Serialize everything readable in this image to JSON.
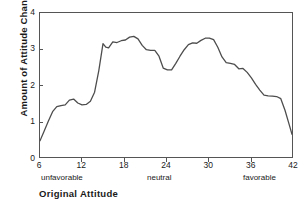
{
  "chart_data": {
    "type": "line",
    "title": "",
    "xlabel": "Original Attitude",
    "ylabel": "Amount of Attitude Change",
    "xlim": [
      6,
      42
    ],
    "ylim": [
      0,
      4
    ],
    "grid": false,
    "legend": null,
    "xticks": [
      6,
      12,
      18,
      24,
      30,
      36,
      42
    ],
    "xtick_labels": [
      "6",
      "12",
      "18",
      "24",
      "30",
      "36",
      "42"
    ],
    "yticks": [
      0,
      1,
      2,
      3,
      4
    ],
    "ytick_labels": [
      "0",
      "1",
      "2",
      "3",
      "4"
    ],
    "annotations": [
      {
        "text": "unfavorable",
        "x": 6,
        "position": "below-axis-left"
      },
      {
        "text": "neutral",
        "x": 24,
        "position": "below-axis-center"
      },
      {
        "text": "favorable",
        "x": 42,
        "position": "below-axis-right"
      }
    ],
    "series": [
      {
        "name": "Amount of Attitude Change",
        "color": "#4d4d4d",
        "x": [
          6.0,
          6.6,
          7.2,
          7.8,
          8.4,
          9.0,
          9.6,
          10.2,
          10.8,
          11.4,
          12.0,
          12.6,
          13.2,
          13.8,
          14.4,
          15.0,
          15.4,
          15.8,
          16.4,
          17.0,
          17.6,
          18.2,
          18.8,
          19.4,
          20.0,
          20.6,
          21.2,
          21.8,
          22.4,
          23.0,
          23.6,
          24.2,
          24.8,
          25.4,
          26.0,
          26.6,
          27.2,
          27.8,
          28.4,
          29.0,
          29.6,
          30.2,
          30.8,
          31.4,
          32.0,
          32.6,
          33.2,
          33.8,
          34.4,
          35.0,
          35.6,
          36.2,
          36.8,
          37.4,
          38.0,
          38.6,
          39.2,
          39.8,
          40.4,
          41.0,
          41.6,
          42.0
        ],
        "y": [
          0.45,
          0.72,
          1.0,
          1.26,
          1.4,
          1.43,
          1.45,
          1.58,
          1.61,
          1.5,
          1.45,
          1.46,
          1.55,
          1.8,
          2.4,
          3.15,
          3.05,
          3.03,
          3.2,
          3.18,
          3.23,
          3.25,
          3.33,
          3.35,
          3.28,
          3.1,
          2.98,
          2.96,
          2.96,
          2.8,
          2.47,
          2.42,
          2.42,
          2.6,
          2.8,
          2.98,
          3.12,
          3.17,
          3.16,
          3.24,
          3.3,
          3.3,
          3.26,
          3.05,
          2.78,
          2.62,
          2.6,
          2.57,
          2.45,
          2.46,
          2.35,
          2.2,
          2.02,
          1.86,
          1.72,
          1.7,
          1.69,
          1.68,
          1.62,
          1.3,
          0.9,
          0.63
        ]
      }
    ]
  },
  "axis": {
    "y_title": "Amount of Attitude Change",
    "x_title": "Original Attitude"
  }
}
